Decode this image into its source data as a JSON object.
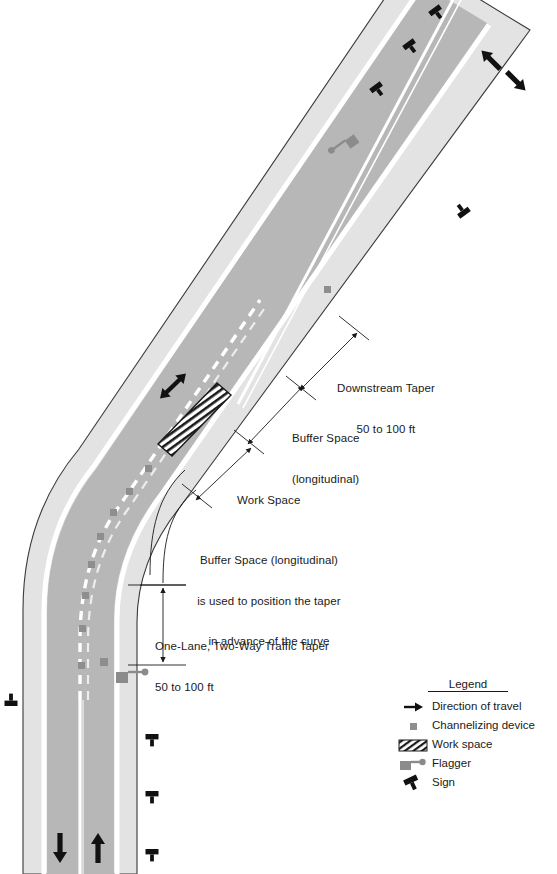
{
  "diagram": {
    "colors": {
      "shoulder": "#e0e0e0",
      "lane": "#b9b9b9",
      "edge_line": "#ffffff",
      "center_line": "#ffffff",
      "outline": "#3a3a3a",
      "device": "#8c8c8c",
      "flagger": "#8c8c8c",
      "arrow": "#111111",
      "text": "#1a1a1a",
      "background": "#ffffff"
    }
  },
  "annotations": [
    {
      "name": "downstream-taper",
      "lines": [
        "Downstream Taper",
        "50 to 100 ft"
      ],
      "x": 337,
      "y": 355,
      "align": "left"
    },
    {
      "name": "buffer-space-longitudinal",
      "lines": [
        "Buffer Space",
        "(longitudinal)"
      ],
      "x": 292,
      "y": 405,
      "align": "left"
    },
    {
      "name": "work-space",
      "lines": [
        "Work Space"
      ],
      "x": 237,
      "y": 467,
      "align": "left"
    },
    {
      "name": "buffer-space-note",
      "lines": [
        "Buffer Space (longitudinal)",
        "is used to position the taper",
        "in advance of the curve"
      ],
      "x": 179,
      "y": 527,
      "align": "center"
    },
    {
      "name": "one-lane-two-way-traffic-taper",
      "lines": [
        "One-Lane, Two-Way Traffic Taper",
        "50 to 100 ft"
      ],
      "x": 155,
      "y": 613,
      "align": "left"
    }
  ],
  "legend": {
    "title": "Legend",
    "items": [
      {
        "icon": "direction-arrow-icon",
        "label": "Direction of travel"
      },
      {
        "icon": "channelizing-device-icon",
        "label": "Channelizing device"
      },
      {
        "icon": "work-space-hatch-icon",
        "label": "Work space"
      },
      {
        "icon": "flagger-icon",
        "label": "Flagger"
      },
      {
        "icon": "sign-icon",
        "label": "Sign"
      }
    ]
  },
  "road_elements": {
    "travel_arrows": [
      {
        "name": "arrow-down-left-lane-bottom",
        "x": 57,
        "y": 848,
        "rot": 90
      },
      {
        "name": "arrow-up-right-lane-bottom",
        "x": 97,
        "y": 848,
        "rot": -90
      },
      {
        "name": "arrow-down-upper-left-lane",
        "x": 491,
        "y": 59,
        "rot": 125
      },
      {
        "name": "arrow-up-upper-right-lane",
        "x": 516,
        "y": 80,
        "rot": -55
      },
      {
        "name": "arrow-two-way-work-zone",
        "x": 172,
        "y": 386,
        "rot": -36
      }
    ],
    "signs": [
      {
        "name": "sign-upper-1",
        "x": 437,
        "y": 13,
        "rot": -35
      },
      {
        "name": "sign-upper-2",
        "x": 411,
        "y": 47,
        "rot": -35
      },
      {
        "name": "sign-upper-3",
        "x": 378,
        "y": 90,
        "rot": -35
      },
      {
        "name": "sign-right-1",
        "x": 462,
        "y": 210,
        "rot": -35
      },
      {
        "name": "sign-left-1",
        "x": 11,
        "y": 700,
        "rot": 0
      },
      {
        "name": "sign-right-2",
        "x": 152,
        "y": 740,
        "rot": 0
      },
      {
        "name": "sign-right-3",
        "x": 152,
        "y": 797,
        "rot": 0
      },
      {
        "name": "sign-right-4",
        "x": 152,
        "y": 855,
        "rot": 0
      }
    ],
    "flaggers": [
      {
        "name": "flagger-upstream",
        "x": 352,
        "y": 148,
        "rot": -35
      },
      {
        "name": "flagger-downstream",
        "x": 120,
        "y": 677,
        "rot": 0
      }
    ],
    "channelizing_devices": [
      {
        "name": "device-1",
        "x": 327,
        "y": 289
      },
      {
        "name": "device-2",
        "x": 104,
        "y": 663
      },
      {
        "name": "device-3",
        "x": 93,
        "y": 570
      },
      {
        "name": "device-4",
        "x": 86,
        "y": 520
      }
    ],
    "work_space": {
      "name": "work-space-hatched-area",
      "x": 195,
      "y": 415,
      "rot": -36
    }
  }
}
